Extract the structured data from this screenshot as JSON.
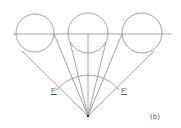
{
  "figure": {
    "panel_label": "(b)",
    "focal_label_left": "F'",
    "focal_label_right": "F'",
    "stroke_color": "#8a8a8a",
    "circles": [
      {
        "cx": 35,
        "cy": 33,
        "r": 19
      },
      {
        "cx": 88,
        "cy": 33,
        "r": 20
      },
      {
        "cx": 142,
        "cy": 33,
        "r": 20
      }
    ],
    "vertex": {
      "x": 88,
      "y": 116
    },
    "horizontal_line": {
      "x1": 13,
      "x2": 171,
      "y": 34
    }
  }
}
